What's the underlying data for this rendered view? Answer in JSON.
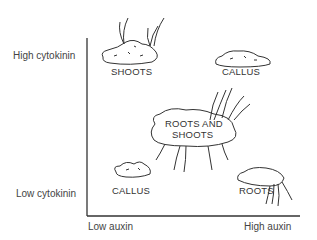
{
  "axes": {
    "y_high": "High cytokinin",
    "y_low": "Low cytokinin",
    "x_low": "Low auxin",
    "x_high": "High auxin"
  },
  "outcomes": {
    "high_cyt_low_aux": "SHOOTS",
    "high_cyt_high_aux": "CALLUS",
    "mid": "ROOTS AND SHOOTS",
    "mid_line1": "ROOTS AND",
    "mid_line2": "SHOOTS",
    "low_cyt_low_aux": "CALLUS",
    "low_cyt_high_aux": "ROOTS"
  }
}
